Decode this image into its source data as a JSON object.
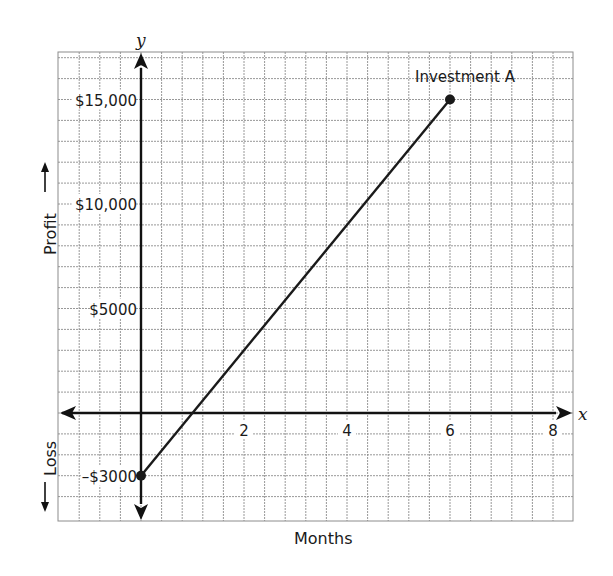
{
  "chart_data": {
    "type": "line",
    "title": "",
    "xlabel": "Months",
    "ylabel_positive": "Profit",
    "ylabel_negative": "Loss",
    "x_axis_variable": "x",
    "y_axis_variable": "y",
    "xlim": [
      -1.6,
      8.4
    ],
    "ylim": [
      -4100,
      17000
    ],
    "x_ticks": [
      2,
      4,
      6,
      8
    ],
    "x_tick_labels": [
      "2",
      "4",
      "6",
      "8"
    ],
    "y_ticks": [
      15000,
      10000,
      5000,
      -3000
    ],
    "y_tick_labels": [
      "$15,000",
      "$10,000",
      "$5000",
      "–$3000"
    ],
    "grid": true,
    "grid_x_step": 0.4,
    "grid_y_step": 1000,
    "series": [
      {
        "name": "Investment A",
        "points": [
          {
            "x": 0,
            "y": -3000
          },
          {
            "x": 6,
            "y": 15000
          }
        ],
        "color": "#1a1a1a",
        "endpoint_markers": true
      }
    ],
    "annotations": [
      {
        "text": "Investment A",
        "x": 6,
        "y": 15000,
        "position": "above"
      }
    ]
  },
  "labels": {
    "profit": "Profit",
    "loss": "Loss",
    "months": "Months",
    "x_var": "x",
    "y_var": "y",
    "series_label": "Investment A"
  },
  "colors": {
    "grid": "#8c8c8c",
    "axis": "#111111",
    "line": "#1a1a1a",
    "text": "#1a1a1a"
  }
}
